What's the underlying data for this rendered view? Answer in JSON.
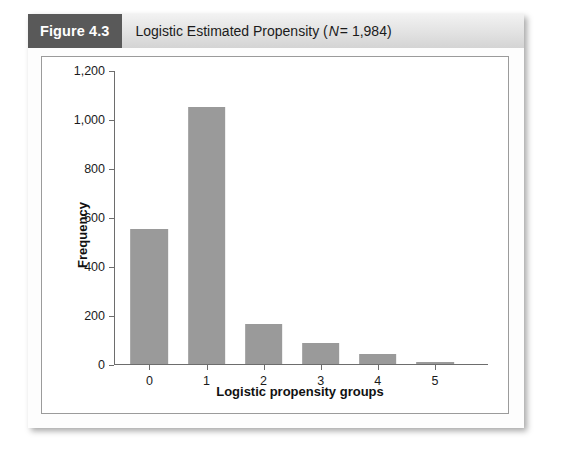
{
  "figure": {
    "number_label": "Figure 4.3",
    "title_prefix": "Logistic Estimated Propensity (",
    "title_italic": "N",
    "title_suffix": " = 1,984)"
  },
  "colors": {
    "bar": "#9a9a9a",
    "axis": "#6d6d6d",
    "header_badge": "#595959",
    "header_band": "#e2e2e2"
  },
  "chart_data": {
    "type": "bar",
    "title": "Logistic Estimated Propensity (N = 1,984)",
    "xlabel": "Logistic propensity groups",
    "ylabel": "Frequency",
    "categories": [
      "0",
      "1",
      "2",
      "3",
      "4",
      "5"
    ],
    "values": [
      550,
      1050,
      165,
      85,
      40,
      10
    ],
    "ylim": [
      0,
      1200
    ],
    "yticks": [
      0,
      200,
      400,
      600,
      800,
      1000,
      1200
    ],
    "ytick_labels": [
      "0",
      "200",
      "400",
      "600",
      "800",
      "1,000",
      "1,200"
    ],
    "xtick_labels": [
      "0",
      "1",
      "2",
      "3",
      "4",
      "5"
    ],
    "grid": false,
    "legend": null,
    "n": 1984
  }
}
